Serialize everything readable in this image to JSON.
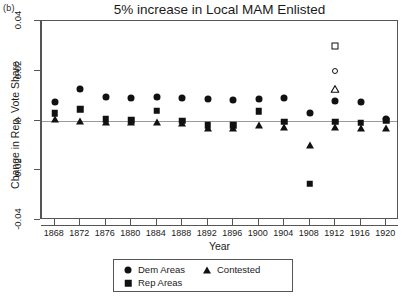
{
  "panel_label": "(b)",
  "chart_data": {
    "type": "scatter",
    "title": "5% increase in Local MAM Enlisted",
    "xlabel": "Year",
    "ylabel": "Change in Rep. Vote Share",
    "xlim": [
      1866,
      1922
    ],
    "ylim": [
      -0.04,
      0.04
    ],
    "grid": false,
    "zero_line": true,
    "legend_position": "bottom-center",
    "x_ticks": [
      1868,
      1872,
      1876,
      1880,
      1884,
      1888,
      1892,
      1896,
      1900,
      1904,
      1908,
      1912,
      1916,
      1920
    ],
    "x_tick_labels": [
      "1868",
      "1872",
      "1876",
      "1880",
      "1884",
      "1888",
      "1892",
      "1896",
      "1900",
      "1904",
      "1908",
      "1912",
      "1916",
      "1920"
    ],
    "y_ticks": [
      0.04,
      0.02,
      0,
      -0.02,
      -0.04
    ],
    "y_tick_labels": [
      "0.04",
      "0.02",
      "0",
      "-0.02",
      "-0.04"
    ],
    "series": [
      {
        "name": "Dem Areas",
        "marker": "circle",
        "fill": "filled",
        "color": "#111111",
        "x": [
          1868,
          1872,
          1876,
          1880,
          1884,
          1888,
          1892,
          1896,
          1900,
          1904,
          1908,
          1912,
          1916,
          1920
        ],
        "y": [
          0.0075,
          0.0128,
          0.0095,
          0.009,
          0.0095,
          0.0092,
          0.0085,
          0.0082,
          0.0085,
          0.009,
          0.003,
          0.008,
          0.0075,
          0.0005
        ]
      },
      {
        "name": "Rep Areas",
        "marker": "square",
        "fill": "filled",
        "color": "#111111",
        "x": [
          1868,
          1872,
          1876,
          1880,
          1884,
          1888,
          1892,
          1896,
          1900,
          1904,
          1908,
          1912,
          1916,
          1920
        ],
        "y": [
          0.003,
          0.0045,
          0.0005,
          0.0002,
          0.004,
          0.0,
          -0.002,
          -0.002,
          0.0038,
          -0.0005,
          -0.0255,
          -0.0005,
          -0.001,
          0.0
        ]
      },
      {
        "name": "Contested",
        "marker": "triangle",
        "fill": "filled",
        "color": "#111111",
        "x": [
          1868,
          1872,
          1876,
          1880,
          1884,
          1888,
          1892,
          1896,
          1900,
          1904,
          1908,
          1912,
          1916,
          1920
        ],
        "y": [
          0.0005,
          0.0,
          -0.0005,
          -0.0005,
          -0.0005,
          -0.001,
          -0.003,
          -0.003,
          -0.002,
          -0.0025,
          -0.01,
          -0.0025,
          -0.003,
          -0.003
        ]
      },
      {
        "name": "Rep Areas Outlier",
        "marker": "square",
        "fill": "open",
        "color": "#111111",
        "x": [
          1912
        ],
        "y": [
          0.03
        ]
      },
      {
        "name": "Dem Areas Outlier",
        "marker": "circle",
        "fill": "open",
        "color": "#111111",
        "x": [
          1912
        ],
        "y": [
          0.02
        ]
      },
      {
        "name": "Contested Outlier",
        "marker": "triangle",
        "fill": "open",
        "color": "#111111",
        "x": [
          1912
        ],
        "y": [
          0.0128
        ]
      }
    ]
  },
  "legend": {
    "entries": [
      {
        "label": "Dem Areas",
        "marker": "circle"
      },
      {
        "label": "Contested",
        "marker": "triangle"
      },
      {
        "label": "Rep Areas",
        "marker": "square"
      }
    ]
  }
}
